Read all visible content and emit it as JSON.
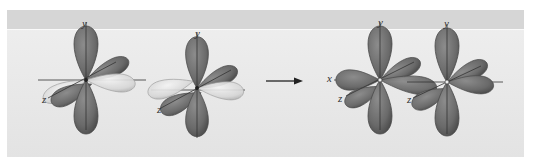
{
  "figure": {
    "type": "orbital-overlap-diagram",
    "colors": {
      "page_bg": "#ffffff",
      "panel_band": "#d6d6d6",
      "panel_bg_top": "#ececec",
      "panel_bg_bottom": "#e2e2e2",
      "lobe_dark": "#6f6f6f",
      "lobe_dark_edge": "#4a4a4a",
      "lobe_light": "#dcdcdc",
      "lobe_light_edge": "#9a9a9a",
      "axis": "#333333",
      "arrow": "#222222"
    },
    "orbitals": [
      {
        "id": "left-1",
        "labels": {
          "y": "y",
          "z": "z"
        }
      },
      {
        "id": "left-2",
        "labels": {
          "y": "y",
          "z": "z"
        }
      },
      {
        "id": "right-1",
        "labels": {
          "y": "y",
          "x": "x",
          "z": "z"
        }
      },
      {
        "id": "right-2",
        "labels": {
          "y": "y",
          "z": "z"
        }
      }
    ],
    "arrow": {
      "direction": "right"
    }
  }
}
